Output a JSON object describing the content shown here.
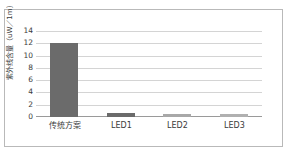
{
  "chart_data": {
    "type": "bar",
    "title": "",
    "subtitle": "",
    "xlabel": "",
    "ylabel": "紫外线含量（uW／1m）",
    "categories": [
      "传统方案",
      "LED1",
      "LED2",
      "LED3"
    ],
    "values": [
      12,
      0.7,
      0.5,
      0.5
    ],
    "series": [
      {
        "name": "紫外线含量",
        "values": [
          12,
          0.7,
          0.5,
          0.5
        ]
      }
    ],
    "ylim": [
      0,
      14
    ],
    "ytick_labels": [
      "14",
      "12",
      "10",
      "8",
      "6",
      "4",
      "2",
      "0"
    ],
    "ytick_values": [
      14,
      12,
      10,
      8,
      6,
      4,
      2,
      0
    ],
    "ytick_step": 2,
    "grid": "horizontal",
    "legend": "none",
    "bar_colors": [
      "#6b6b6b",
      "#6b6b6b",
      "#a8a8a8",
      "#b0b0b0"
    ],
    "colors": {
      "gridline": "#d4d4d4",
      "axis": "#9a9a9a",
      "text": "#3b3b3b",
      "frame": "#b9b9b9",
      "background": "#ffffff"
    }
  }
}
